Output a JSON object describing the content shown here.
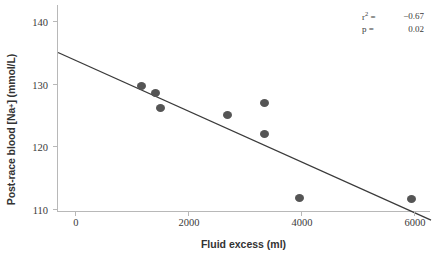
{
  "chart_data": {
    "type": "scatter",
    "title": "",
    "xlabel": "Fluid excess (ml)",
    "ylabel": "Post-race blood [Na",
    "ylabel_sup": "+",
    "ylabel_tail": "] (mmol/L)",
    "xlim": [
      -300,
      6300
    ],
    "ylim": [
      109.5,
      142.6
    ],
    "xticks": [
      0,
      2000,
      4000,
      6000
    ],
    "xtick_labels": [
      "0",
      "2000",
      "4000",
      "6000"
    ],
    "yticks": [
      110,
      120,
      130,
      140
    ],
    "ytick_labels": [
      "110",
      "120",
      "130",
      "140"
    ],
    "grid": false,
    "legend": null,
    "points": [
      {
        "x": 1180,
        "y": 129.6
      },
      {
        "x": 1430,
        "y": 128.6
      },
      {
        "x": 1510,
        "y": 126.2
      },
      {
        "x": 2700,
        "y": 125.0
      },
      {
        "x": 3350,
        "y": 126.9
      },
      {
        "x": 3360,
        "y": 122.0
      },
      {
        "x": 3980,
        "y": 111.7
      },
      {
        "x": 5960,
        "y": 111.5
      }
    ],
    "fit_line": {
      "x_start": -300,
      "y_start": 135.0,
      "x_end": 6300,
      "y_end": 108.2
    },
    "annotations": {
      "r2_label": "r",
      "r2_sup": "2",
      "r2_eq": "=",
      "r2_value": "−0.67",
      "p_label": "p",
      "p_eq": "=",
      "p_value": "0.02"
    },
    "colors": {
      "marker": "#555555",
      "line": "#3a3a3a",
      "axis": "#b8b8b8",
      "text": "#3a3a3a"
    }
  }
}
